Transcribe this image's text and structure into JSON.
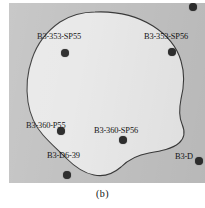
{
  "figure": {
    "caption": "(b)",
    "panel": {
      "background_color": "#c2c2c2",
      "region_fill_color": "#e9e9e9",
      "region_stroke_color": "#3a3a3a",
      "marker_color": "#2e2e2e",
      "label_color": "#141414"
    },
    "region": {
      "name": "irregular-survey-boundary",
      "path": "M 86 9 C 108 8 128 13 144 23 C 158 32 168 44 172 58 C 176 71 175 84 172 96 C 170 106 170 114 173 121 C 176 128 176 135 170 140 C 163 146 152 148 140 150 C 128 152 119 157 112 164 C 104 171 95 174 85 172 C 74 170 65 163 57 155 C 49 147 41 140 34 132 C 26 123 21 112 19 99 C 17 85 18 70 23 56 C 28 41 38 28 51 19 C 62 12 74 9 86 9 Z"
    },
    "markers": [
      {
        "name": "marker-b3-353-sp55",
        "x": 56,
        "y": 50,
        "r": 4.4
      },
      {
        "name": "marker-b3-353-sp56",
        "x": 163,
        "y": 49,
        "r": 4.0
      },
      {
        "name": "marker-b3-360-p55",
        "x": 52,
        "y": 128,
        "r": 4.4
      },
      {
        "name": "marker-b3-360-sp56",
        "x": 114,
        "y": 137,
        "r": 4.4
      },
      {
        "name": "marker-b3-d6-39",
        "x": 58,
        "y": 172,
        "r": 4.0
      },
      {
        "name": "marker-b3-d-right",
        "x": 190,
        "y": 158,
        "r": 4.4
      },
      {
        "name": "marker-top-edge-partial",
        "x": 184,
        "y": 4,
        "r": 4.0
      }
    ],
    "labels": [
      {
        "name": "label-b3-353-sp55",
        "text": "B3-353-SP55",
        "x": 28,
        "y": 30
      },
      {
        "name": "label-b3-353-sp56",
        "text": "B3-353-SP56",
        "x": 135,
        "y": 30
      },
      {
        "name": "label-b3-360-p55",
        "text": "B3-360-P55",
        "x": 17,
        "y": 119
      },
      {
        "name": "label-b3-360-sp56",
        "text": "B3-360-SP56",
        "x": 85,
        "y": 124
      },
      {
        "name": "label-b3-d6-39",
        "text": "B3-D6-39",
        "x": 38,
        "y": 149
      },
      {
        "name": "label-b3-d-right",
        "text": "B3-D",
        "x": 166,
        "y": 150
      }
    ]
  }
}
